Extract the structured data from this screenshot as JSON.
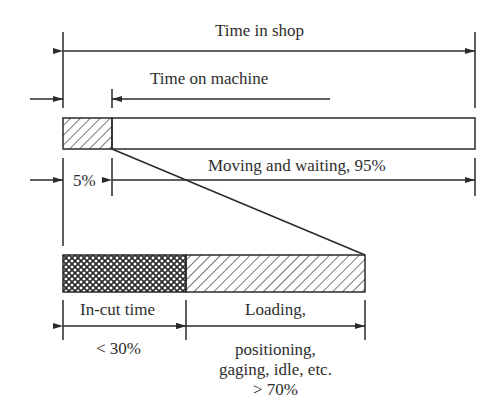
{
  "diagram": {
    "title": "Time in shop",
    "labels": {
      "time_in_shop": "Time in shop",
      "time_on_machine": "Time on machine",
      "moving_waiting": "Moving and waiting, 95%",
      "machine_pct": "5%",
      "in_cut": "In-cut time",
      "in_cut_pct": "< 30%",
      "loading_line1": "Loading,",
      "loading_line2": "positioning,",
      "loading_line3": "gaging, idle, etc.",
      "loading_pct": "> 70%"
    },
    "segments": {
      "top_bar": [
        {
          "name": "Time on machine",
          "percent": 5,
          "pattern": "hatch"
        },
        {
          "name": "Moving and waiting",
          "percent": 95,
          "pattern": "none"
        }
      ],
      "bottom_bar": [
        {
          "name": "In-cut time",
          "percent": "< 30",
          "pattern": "crosshatch"
        },
        {
          "name": "Loading, positioning, gaging, idle, etc.",
          "percent": "> 70",
          "pattern": "hatch"
        }
      ]
    },
    "colors": {
      "line": "#2a2a2a",
      "background": "#ffffff"
    }
  }
}
